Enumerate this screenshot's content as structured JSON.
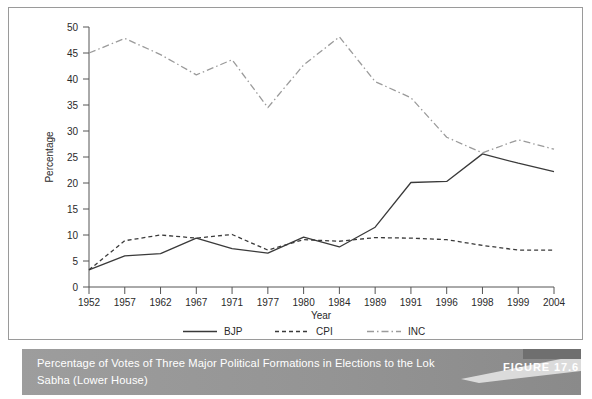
{
  "figure": {
    "number_label": "FIGURE 17.6",
    "caption": "Percentage of Votes of Three Major Political Formations in Elections to the Lok Sabha (Lower House)"
  },
  "colors": {
    "bjp": "#3a3a3a",
    "cpi": "#3a3a3a",
    "inc": "#9b9b9b",
    "axis": "#555555",
    "text": "#2a2a2a",
    "caption_bar": "#949494",
    "caption_text": "#ffffff",
    "frame_border": "#9a9a9a",
    "plot_background": "#ffffff"
  },
  "chart_data": {
    "type": "line",
    "title": "",
    "xlabel": "Year",
    "ylabel": "Percentage",
    "ylim": [
      0,
      50
    ],
    "yticks": [
      0,
      5,
      10,
      15,
      20,
      25,
      30,
      35,
      40,
      45,
      50
    ],
    "grid": false,
    "legend_position": "bottom",
    "categories": [
      "1952",
      "1957",
      "1962",
      "1967",
      "1971",
      "1977",
      "1980",
      "1984",
      "1989",
      "1991",
      "1996",
      "1998",
      "1999",
      "2004"
    ],
    "series": [
      {
        "name": "BJP",
        "line_style": "solid",
        "values": [
          3.3,
          6.0,
          6.4,
          9.4,
          7.4,
          6.5,
          9.6,
          7.7,
          11.5,
          20.1,
          20.3,
          25.6,
          23.8,
          22.2
        ]
      },
      {
        "name": "CPI",
        "line_style": "dashed",
        "values": [
          3.3,
          8.9,
          10.0,
          9.4,
          10.1,
          7.1,
          9.1,
          8.8,
          9.5,
          9.4,
          9.1,
          8.0,
          7.1,
          7.1
        ]
      },
      {
        "name": "INC",
        "line_style": "dashdot",
        "values": [
          45.0,
          47.8,
          44.7,
          40.8,
          43.7,
          34.5,
          42.7,
          48.1,
          39.5,
          36.4,
          28.8,
          25.8,
          28.3,
          26.5
        ]
      }
    ]
  }
}
